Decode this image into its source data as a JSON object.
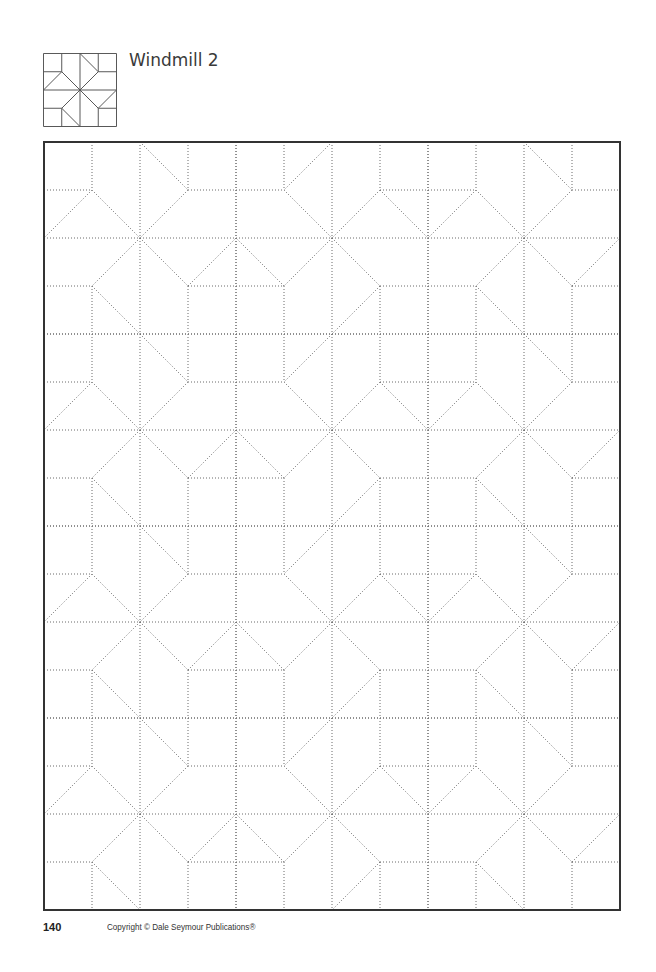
{
  "header": {
    "title": "Windmill 2",
    "thumbnail_label": "windmill-2-block-preview"
  },
  "footer": {
    "page_number": "140",
    "copyright": "Copyright © Dale Seymour Publications®"
  },
  "grid": {
    "columns": 12,
    "rows": 16,
    "block_size": 4,
    "cell_px": 48,
    "border_color": "#333333",
    "line_color": "#6a6a6a",
    "block_layout": [
      [
        "A",
        "B",
        "A"
      ],
      [
        "A",
        "B",
        "A"
      ],
      [
        "A",
        "B",
        "A"
      ],
      [
        "A",
        "B",
        "A"
      ]
    ]
  },
  "block_pattern": {
    "straight_segments": [
      [
        0,
        0,
        4,
        0
      ],
      [
        0,
        4,
        4,
        4
      ],
      [
        0,
        0,
        0,
        4
      ],
      [
        4,
        0,
        4,
        4
      ],
      [
        1,
        0,
        1,
        1
      ],
      [
        1,
        3,
        1,
        4
      ],
      [
        2,
        0,
        2,
        4
      ],
      [
        3,
        0,
        3,
        1
      ],
      [
        3,
        3,
        3,
        4
      ],
      [
        0,
        1,
        1,
        1
      ],
      [
        3,
        1,
        4,
        1
      ],
      [
        0,
        2,
        4,
        2
      ],
      [
        0,
        3,
        1,
        3
      ],
      [
        3,
        3,
        4,
        3
      ]
    ],
    "diagonals_A": [
      [
        2,
        0,
        3,
        1
      ],
      [
        3,
        1,
        2,
        2
      ],
      [
        1,
        1,
        2,
        2
      ],
      [
        1,
        1,
        0,
        2
      ],
      [
        2,
        2,
        1,
        3
      ],
      [
        1,
        3,
        2,
        4
      ],
      [
        2,
        2,
        3,
        3
      ],
      [
        3,
        3,
        4,
        2
      ]
    ]
  }
}
